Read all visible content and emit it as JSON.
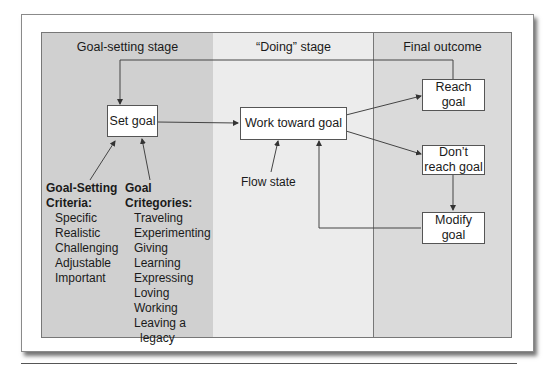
{
  "stages": {
    "goal_setting": "Goal-setting stage",
    "doing": "“Doing” stage",
    "final": "Final outcome"
  },
  "nodes": {
    "set_goal": "Set goal",
    "work_toward_goal": "Work toward goal",
    "reach_goal": "Reach goal",
    "dont_reach_goal_line1": "Don’t",
    "dont_reach_goal_line2": "reach goal",
    "modify_goal": "Modify goal"
  },
  "annotations": {
    "flow_state": "Flow state"
  },
  "criteria": {
    "title_line1": "Goal-Setting",
    "title_line2": "Criteria:",
    "items": [
      "Specific",
      "Realistic",
      "Challenging",
      "Adjustable",
      "Important"
    ]
  },
  "categories": {
    "title_line1": "Goal",
    "title_line2": "Critegories:",
    "items": [
      "Traveling",
      "Experimenting",
      "Giving",
      "Learning",
      "Expressing",
      "Loving",
      "Working",
      "Leaving a",
      "legacy"
    ]
  },
  "colors": {
    "goal_setting_bg": "#d0d0d0",
    "doing_bg": "#ececec",
    "final_bg": "#dadada"
  }
}
